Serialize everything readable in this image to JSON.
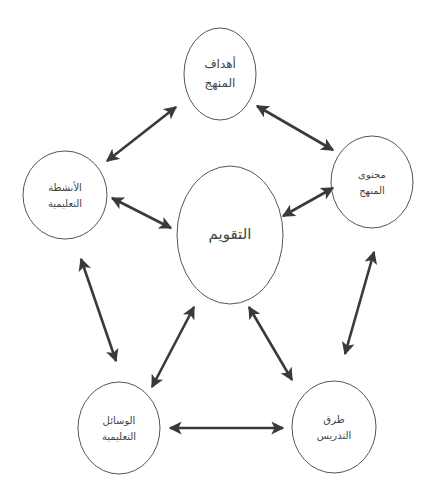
{
  "diagram": {
    "colors": {
      "background": "#ffffff",
      "node_stroke": "#555555",
      "arrow": "#3a3a3a",
      "text": "#444444"
    },
    "nodes": {
      "center": {
        "id": "evaluation",
        "line1": "التقويم",
        "line2": "",
        "cx": 230,
        "cy": 235,
        "rx": 53,
        "ry": 69
      },
      "top": {
        "id": "curriculum-objectives",
        "line1": "أهداف",
        "line2": "المنهج",
        "cx": 220,
        "cy": 74,
        "rx": 36,
        "ry": 46
      },
      "right": {
        "id": "curriculum-content",
        "line1": "محتوى",
        "line2": "المنهج",
        "cx": 372,
        "cy": 182,
        "rx": 41,
        "ry": 46
      },
      "left": {
        "id": "educational-activities",
        "line1": "الأنشطة",
        "line2": "التعليمية",
        "cx": 65,
        "cy": 195,
        "rx": 42,
        "ry": 44
      },
      "bottom_left": {
        "id": "educational-aids",
        "line1": "الوسائل",
        "line2": "التعليمية",
        "cx": 119,
        "cy": 428,
        "rx": 41,
        "ry": 46
      },
      "bottom_right": {
        "id": "teaching-methods",
        "line1": "طرق",
        "line2": "التدريس",
        "cx": 334,
        "cy": 427,
        "rx": 42,
        "ry": 46
      }
    },
    "edges": [
      {
        "from": "educational-activities",
        "to": "curriculum-objectives",
        "x1": 107,
        "y1": 161,
        "x2": 176,
        "y2": 107,
        "bidirectional": true
      },
      {
        "from": "curriculum-objectives",
        "to": "curriculum-content",
        "x1": 257,
        "y1": 106,
        "x2": 333,
        "y2": 150,
        "bidirectional": true
      },
      {
        "from": "educational-activities",
        "to": "evaluation",
        "x1": 112,
        "y1": 198,
        "x2": 171,
        "y2": 228,
        "bidirectional": true
      },
      {
        "from": "curriculum-content",
        "to": "evaluation",
        "x1": 333,
        "y1": 188,
        "x2": 283,
        "y2": 216,
        "bidirectional": true
      },
      {
        "from": "educational-activities",
        "to": "educational-aids",
        "x1": 81,
        "y1": 259,
        "x2": 116,
        "y2": 361,
        "bidirectional": true
      },
      {
        "from": "curriculum-content",
        "to": "teaching-methods",
        "x1": 374,
        "y1": 252,
        "x2": 345,
        "y2": 354,
        "bidirectional": true
      },
      {
        "from": "evaluation",
        "to": "educational-aids",
        "x1": 194,
        "y1": 307,
        "x2": 152,
        "y2": 387,
        "bidirectional": true
      },
      {
        "from": "evaluation",
        "to": "teaching-methods",
        "x1": 249,
        "y1": 307,
        "x2": 292,
        "y2": 380,
        "bidirectional": true
      },
      {
        "from": "educational-aids",
        "to": "teaching-methods",
        "x1": 170,
        "y1": 428,
        "x2": 283,
        "y2": 428,
        "bidirectional": true
      }
    ]
  }
}
